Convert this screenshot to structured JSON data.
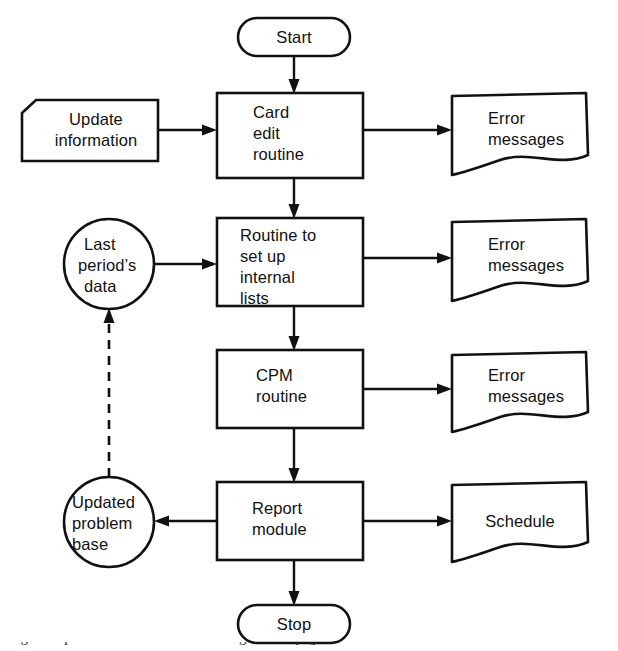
{
  "diagram": {
    "type": "flowchart",
    "background_color": "#ffffff",
    "line_color": "#111111",
    "nodes": [
      {
        "id": "start",
        "shape": "terminator",
        "label": "Start",
        "lines": [
          "Start"
        ],
        "x": 238,
        "y": 18,
        "width": 112,
        "height": 38
      },
      {
        "id": "update-information",
        "shape": "punched-card",
        "label": "Update information",
        "lines": [
          "Update",
          "information"
        ],
        "x": 22,
        "y": 100,
        "width": 136,
        "height": 61
      },
      {
        "id": "card-edit-routine",
        "shape": "process",
        "label": "Card edit routine",
        "lines": [
          "Card",
          "edit",
          "routine"
        ],
        "x": 217,
        "y": 93,
        "width": 146,
        "height": 85
      },
      {
        "id": "error-messages-1",
        "shape": "document",
        "label": "Error messages",
        "lines": [
          "Error",
          "messages"
        ],
        "x": 452,
        "y": 93,
        "width": 136,
        "height": 82
      },
      {
        "id": "last-periods-data",
        "shape": "circle",
        "label": "Last period’s data",
        "lines": [
          "Last",
          "period’s",
          "data"
        ],
        "cx": 109,
        "cy": 264,
        "r": 45
      },
      {
        "id": "routine-set-up-internal-lists",
        "shape": "process",
        "label": "Routine to set up internal lists",
        "lines": [
          "Routine to",
          "set up",
          "internal",
          "lists"
        ],
        "x": 217,
        "y": 218,
        "width": 146,
        "height": 88
      },
      {
        "id": "error-messages-2",
        "shape": "document",
        "label": "Error messages",
        "lines": [
          "Error",
          "messages"
        ],
        "x": 452,
        "y": 219,
        "width": 136,
        "height": 82
      },
      {
        "id": "cpm-routine",
        "shape": "process",
        "label": "CPM routine",
        "lines": [
          "CPM",
          "routine"
        ],
        "x": 217,
        "y": 350,
        "width": 146,
        "height": 78
      },
      {
        "id": "error-messages-3",
        "shape": "document",
        "label": "Error messages",
        "lines": [
          "Error",
          "messages"
        ],
        "x": 452,
        "y": 352,
        "width": 136,
        "height": 80
      },
      {
        "id": "updated-problem-base",
        "shape": "circle",
        "label": "Updated problem base",
        "lines": [
          "Updated",
          "problem",
          "base"
        ],
        "cx": 109,
        "cy": 522,
        "r": 45
      },
      {
        "id": "report-module",
        "shape": "process",
        "label": "Report module",
        "lines": [
          "Report",
          "module"
        ],
        "x": 217,
        "y": 482,
        "width": 146,
        "height": 78
      },
      {
        "id": "schedule",
        "shape": "document",
        "label": "Schedule",
        "lines": [
          "Schedule"
        ],
        "x": 452,
        "y": 482,
        "width": 136,
        "height": 80
      },
      {
        "id": "stop",
        "shape": "terminator",
        "label": "Stop",
        "lines": [
          "Stop"
        ],
        "x": 238,
        "y": 605,
        "width": 112,
        "height": 38
      }
    ],
    "edges": [
      {
        "id": "start-to-card-edit",
        "from": "start",
        "to": "card-edit-routine",
        "style": "solid",
        "arrow": "down"
      },
      {
        "id": "update-info-to-card-edit",
        "from": "update-information",
        "to": "card-edit-routine",
        "style": "solid",
        "arrow": "right"
      },
      {
        "id": "card-edit-to-error-1",
        "from": "card-edit-routine",
        "to": "error-messages-1",
        "style": "solid",
        "arrow": "right"
      },
      {
        "id": "card-edit-to-routine-lists",
        "from": "card-edit-routine",
        "to": "routine-set-up-internal-lists",
        "style": "solid",
        "arrow": "down"
      },
      {
        "id": "last-periods-data-to-routine-lists",
        "from": "last-periods-data",
        "to": "routine-set-up-internal-lists",
        "style": "solid",
        "arrow": "right"
      },
      {
        "id": "routine-lists-to-error-2",
        "from": "routine-set-up-internal-lists",
        "to": "error-messages-2",
        "style": "solid",
        "arrow": "right"
      },
      {
        "id": "routine-lists-to-cpm",
        "from": "routine-set-up-internal-lists",
        "to": "cpm-routine",
        "style": "solid",
        "arrow": "down"
      },
      {
        "id": "cpm-to-error-3",
        "from": "cpm-routine",
        "to": "error-messages-3",
        "style": "solid",
        "arrow": "right"
      },
      {
        "id": "cpm-to-report-module",
        "from": "cpm-routine",
        "to": "report-module",
        "style": "solid",
        "arrow": "down"
      },
      {
        "id": "report-module-to-updated-problem-base",
        "from": "report-module",
        "to": "updated-problem-base",
        "style": "solid",
        "arrow": "left"
      },
      {
        "id": "report-module-to-schedule",
        "from": "report-module",
        "to": "schedule",
        "style": "solid",
        "arrow": "right"
      },
      {
        "id": "report-module-to-stop",
        "from": "report-module",
        "to": "stop",
        "style": "solid",
        "arrow": "down"
      },
      {
        "id": "updated-problem-base-to-last-periods-data",
        "from": "updated-problem-base",
        "to": "last-periods-data",
        "style": "dashed",
        "arrow": "up"
      }
    ],
    "caption": {
      "clipped": true,
      "text": "Figure caption cut off at the bottom edge of the page"
    }
  }
}
